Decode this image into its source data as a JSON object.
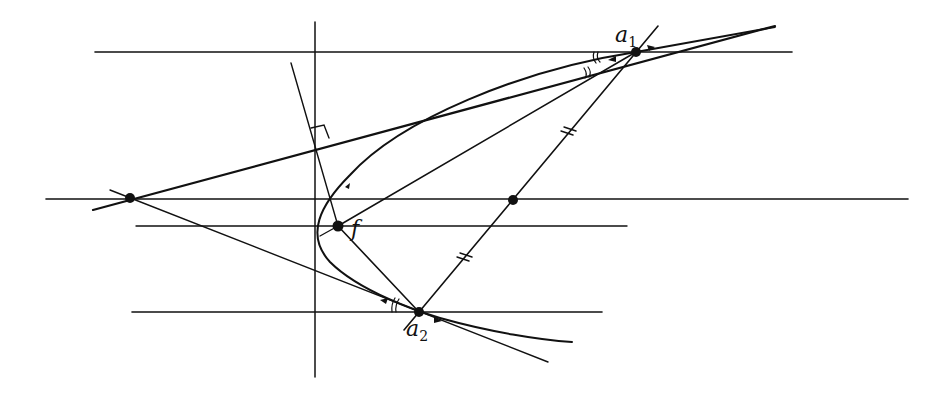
{
  "diagram": {
    "type": "geometric-construction",
    "colors": {
      "ink": "#111111",
      "background": "#ffffff"
    },
    "labels": {
      "a1": {
        "base": "a",
        "sub": "1"
      },
      "a2": {
        "base": "a",
        "sub": "2"
      },
      "focus": "f"
    },
    "points": [
      {
        "id": "a1",
        "x": 636,
        "y": 52
      },
      {
        "id": "a2",
        "x": 419,
        "y": 312
      },
      {
        "id": "focus",
        "x": 338,
        "y": 226
      },
      {
        "id": "midpoint",
        "x": 513,
        "y": 200
      },
      {
        "id": "tangent-intersection",
        "x": 130,
        "y": 198
      }
    ],
    "horizontal_lines": [
      {
        "y": 52,
        "x1": 95,
        "x2": 792
      },
      {
        "y": 199,
        "x1": 46,
        "x2": 908
      },
      {
        "y": 226,
        "x1": 136,
        "x2": 627
      },
      {
        "y": 312,
        "x1": 132,
        "x2": 602
      }
    ],
    "vertical_line": {
      "x": 315,
      "y1": 22,
      "y2": 377
    },
    "markings": {
      "equal_segments": "double tick marks on chord a1-a2 either side of midpoint",
      "equal_angles": "double arcs at a1 and a2",
      "right_angle": "square at foot of perpendicular on upper tangent"
    }
  }
}
